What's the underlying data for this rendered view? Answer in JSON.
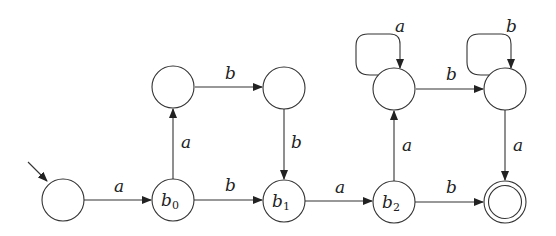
{
  "diagram": {
    "type": "finite-automaton",
    "start_state": "q0",
    "accept_states": [
      "qf"
    ],
    "states": [
      {
        "id": "q0",
        "label": "",
        "x": 63,
        "y": 200
      },
      {
        "id": "b0",
        "label": "b",
        "sub": "0",
        "x": 173,
        "y": 200
      },
      {
        "id": "b1",
        "label": "b",
        "sub": "1",
        "x": 284,
        "y": 201
      },
      {
        "id": "b2",
        "label": "b",
        "sub": "2",
        "x": 394,
        "y": 202
      },
      {
        "id": "qf",
        "label": "",
        "x": 505,
        "y": 202
      },
      {
        "id": "u0",
        "label": "",
        "x": 173,
        "y": 87
      },
      {
        "id": "u1",
        "label": "",
        "x": 284,
        "y": 88
      },
      {
        "id": "u2",
        "label": "",
        "x": 394,
        "y": 89
      },
      {
        "id": "u3",
        "label": "",
        "x": 505,
        "y": 89
      }
    ],
    "transitions": [
      {
        "from": "q0",
        "to": "b0",
        "symbol": "a"
      },
      {
        "from": "b0",
        "to": "b1",
        "symbol": "b"
      },
      {
        "from": "b1",
        "to": "b2",
        "symbol": "a"
      },
      {
        "from": "b2",
        "to": "qf",
        "symbol": "b"
      },
      {
        "from": "b0",
        "to": "u0",
        "symbol": "a"
      },
      {
        "from": "u0",
        "to": "u1",
        "symbol": "b"
      },
      {
        "from": "u1",
        "to": "b1",
        "symbol": "b"
      },
      {
        "from": "b2",
        "to": "u2",
        "symbol": "a"
      },
      {
        "from": "u2",
        "to": "u2",
        "symbol": "a"
      },
      {
        "from": "u2",
        "to": "u3",
        "symbol": "b"
      },
      {
        "from": "u3",
        "to": "u3",
        "symbol": "b"
      },
      {
        "from": "u3",
        "to": "qf",
        "symbol": "a"
      }
    ],
    "labels": {
      "b0": "b",
      "b0_sub": "0",
      "b1": "b",
      "b1_sub": "1",
      "b2": "b",
      "b2_sub": "2",
      "t_q0_b0": "a",
      "t_b0_b1": "b",
      "t_b1_b2": "a",
      "t_b2_qf": "b",
      "t_b0_u0": "a",
      "t_u0_u1": "b",
      "t_u1_b1": "b",
      "t_b2_u2": "a",
      "t_u2_u2": "a",
      "t_u2_u3": "b",
      "t_u3_u3": "b",
      "t_u3_qf": "a"
    }
  }
}
